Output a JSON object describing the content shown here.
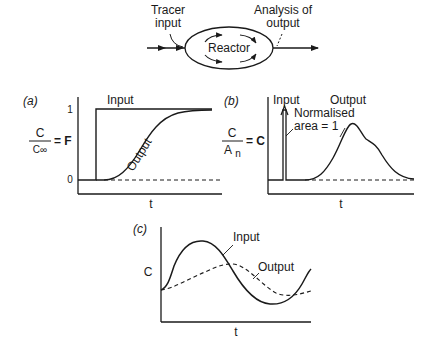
{
  "reactor_schematic": {
    "reactor_label": "Reactor",
    "tracer_input_label_line1": "Tracer",
    "tracer_input_label_line2": "input",
    "analysis_label_line1": "Analysis of",
    "analysis_label_line2": "output"
  },
  "panel_a": {
    "tag": "(a)",
    "y_num": "C",
    "y_den": "C∞",
    "y_eq": "= F",
    "tick_1": "1",
    "tick_0": "0",
    "input_label": "Input",
    "output_label": "Output",
    "x_label": "t"
  },
  "panel_b": {
    "tag": "(b)",
    "y_num": "C",
    "y_den_main": "A",
    "y_den_sub": "n",
    "y_eq": "= C",
    "input_label": "Input",
    "output_label": "Output",
    "note_line1": "Normalised",
    "note_line2": "area = 1",
    "x_label": "t"
  },
  "panel_c": {
    "tag": "(c)",
    "y_label": "C",
    "input_label": "Input",
    "output_label": "Output",
    "x_label": "t"
  },
  "colors": {
    "ink": "#1a1a1a",
    "background": "#ffffff"
  }
}
